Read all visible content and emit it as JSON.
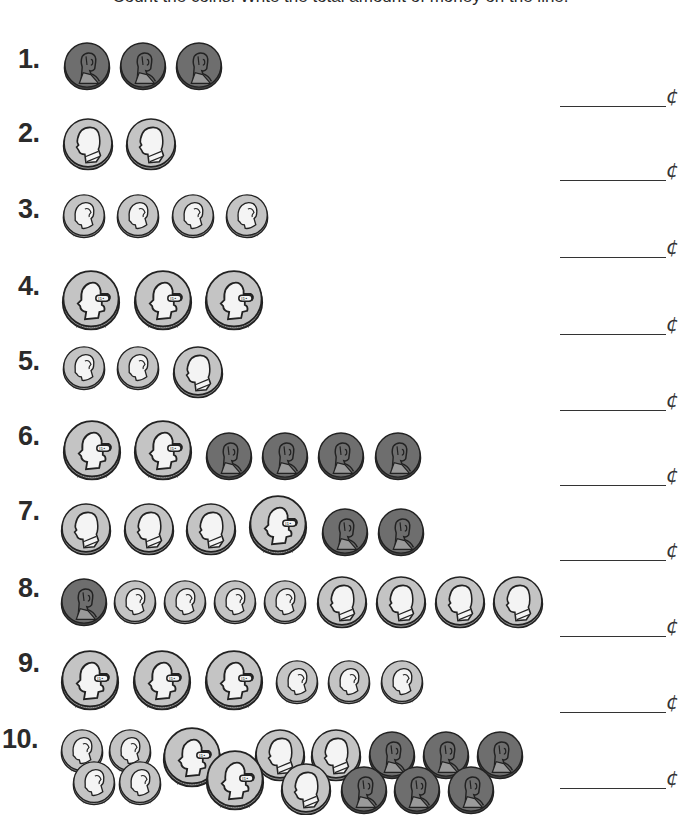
{
  "instructions": "Count the coins. Write the total amount of money on the line.",
  "cent_symbol": "¢",
  "coin_types": {
    "penny": {
      "value": 1,
      "size": 48,
      "fill": "#6e6e6e",
      "rim": "#4a4a4a",
      "face": "#8a8a8a",
      "portrait": "lincoln"
    },
    "nickel": {
      "value": 5,
      "size": 52,
      "fill": "#c4c4c4",
      "rim": "#9a9a9a",
      "face": "#f2f2f2",
      "portrait": "jefferson"
    },
    "dime": {
      "value": 10,
      "size": 44,
      "fill": "#c4c4c4",
      "rim": "#9a9a9a",
      "face": "#f2f2f2",
      "portrait": "roosevelt"
    },
    "quarter": {
      "value": 25,
      "size": 60,
      "fill": "#c4c4c4",
      "rim": "#9a9a9a",
      "face": "#f2f2f2",
      "portrait": "washington"
    }
  },
  "problems": [
    {
      "label": "1.",
      "num_y": 44,
      "line_y": 106,
      "coins": [
        {
          "type": "penny",
          "x": 63,
          "y": 42
        },
        {
          "type": "penny",
          "x": 119,
          "y": 42
        },
        {
          "type": "penny",
          "x": 175,
          "y": 42
        }
      ]
    },
    {
      "label": "2.",
      "num_y": 118,
      "line_y": 180,
      "coins": [
        {
          "type": "nickel",
          "x": 62,
          "y": 118
        },
        {
          "type": "nickel",
          "x": 125,
          "y": 118
        }
      ]
    },
    {
      "label": "3.",
      "num_y": 194,
      "line_y": 257,
      "coins": [
        {
          "type": "dime",
          "x": 62,
          "y": 194
        },
        {
          "type": "dime",
          "x": 116,
          "y": 194
        },
        {
          "type": "dime",
          "x": 171,
          "y": 194
        },
        {
          "type": "dime",
          "x": 225,
          "y": 194
        }
      ]
    },
    {
      "label": "4.",
      "num_y": 271,
      "line_y": 334,
      "coins": [
        {
          "type": "quarter",
          "x": 61,
          "y": 270
        },
        {
          "type": "quarter",
          "x": 133,
          "y": 270
        },
        {
          "type": "quarter",
          "x": 204,
          "y": 270
        }
      ]
    },
    {
      "label": "5.",
      "num_y": 346,
      "line_y": 410,
      "coins": [
        {
          "type": "dime",
          "x": 62,
          "y": 346
        },
        {
          "type": "dime",
          "x": 116,
          "y": 346
        },
        {
          "type": "nickel",
          "x": 172,
          "y": 346
        }
      ]
    },
    {
      "label": "6.",
      "num_y": 421,
      "line_y": 485,
      "coins": [
        {
          "type": "quarter",
          "x": 62,
          "y": 420
        },
        {
          "type": "quarter",
          "x": 133,
          "y": 420
        },
        {
          "type": "penny",
          "x": 205,
          "y": 432
        },
        {
          "type": "penny",
          "x": 261,
          "y": 432
        },
        {
          "type": "penny",
          "x": 317,
          "y": 432
        },
        {
          "type": "penny",
          "x": 374,
          "y": 432
        }
      ]
    },
    {
      "label": "7.",
      "num_y": 496,
      "line_y": 560,
      "coins": [
        {
          "type": "nickel",
          "x": 60,
          "y": 503
        },
        {
          "type": "nickel",
          "x": 123,
          "y": 503
        },
        {
          "type": "nickel",
          "x": 185,
          "y": 503
        },
        {
          "type": "quarter",
          "x": 248,
          "y": 495
        },
        {
          "type": "penny",
          "x": 321,
          "y": 508
        },
        {
          "type": "penny",
          "x": 377,
          "y": 508
        }
      ]
    },
    {
      "label": "8.",
      "num_y": 573,
      "line_y": 636,
      "coins": [
        {
          "type": "penny",
          "x": 60,
          "y": 578
        },
        {
          "type": "dime",
          "x": 113,
          "y": 580
        },
        {
          "type": "dime",
          "x": 163,
          "y": 580
        },
        {
          "type": "dime",
          "x": 213,
          "y": 580
        },
        {
          "type": "dime",
          "x": 263,
          "y": 580
        },
        {
          "type": "nickel",
          "x": 316,
          "y": 576
        },
        {
          "type": "nickel",
          "x": 375,
          "y": 576
        },
        {
          "type": "nickel",
          "x": 434,
          "y": 576
        },
        {
          "type": "nickel",
          "x": 492,
          "y": 576
        }
      ]
    },
    {
      "label": "9.",
      "num_y": 648,
      "line_y": 712,
      "coins": [
        {
          "type": "quarter",
          "x": 60,
          "y": 650
        },
        {
          "type": "quarter",
          "x": 132,
          "y": 650
        },
        {
          "type": "quarter",
          "x": 204,
          "y": 650
        },
        {
          "type": "dime",
          "x": 275,
          "y": 660
        },
        {
          "type": "dime",
          "x": 327,
          "y": 660
        },
        {
          "type": "dime",
          "x": 380,
          "y": 660
        }
      ]
    },
    {
      "label": "10.",
      "num_y": 724,
      "line_y": 788,
      "coins": [
        {
          "type": "dime",
          "x": 60,
          "y": 729
        },
        {
          "type": "dime",
          "x": 108,
          "y": 729
        },
        {
          "type": "quarter",
          "x": 162,
          "y": 727
        },
        {
          "type": "nickel",
          "x": 254,
          "y": 729
        },
        {
          "type": "nickel",
          "x": 310,
          "y": 729
        },
        {
          "type": "penny",
          "x": 368,
          "y": 731
        },
        {
          "type": "penny",
          "x": 422,
          "y": 731
        },
        {
          "type": "penny",
          "x": 476,
          "y": 731
        },
        {
          "type": "dime",
          "x": 72,
          "y": 761
        },
        {
          "type": "dime",
          "x": 118,
          "y": 761
        },
        {
          "type": "quarter",
          "x": 205,
          "y": 750
        },
        {
          "type": "nickel",
          "x": 280,
          "y": 763
        },
        {
          "type": "penny",
          "x": 340,
          "y": 766
        },
        {
          "type": "penny",
          "x": 393,
          "y": 766
        },
        {
          "type": "penny",
          "x": 447,
          "y": 766
        }
      ]
    }
  ]
}
